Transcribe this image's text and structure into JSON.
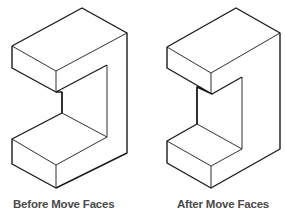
{
  "diagram": {
    "panels": [
      {
        "id": "before",
        "caption": "Before Move Faces",
        "shape": "C-shaped isometric block",
        "outline": [
          [
            82,
            8
          ],
          [
            127,
            33
          ],
          [
            127,
            153
          ],
          [
            56,
            188
          ],
          [
            12,
            164
          ],
          [
            12,
            139
          ],
          [
            62,
            113
          ],
          [
            62,
            92
          ],
          [
            56,
            92
          ],
          [
            12,
            68
          ],
          [
            12,
            46
          ]
        ],
        "upper_front_face": [
          [
            12,
            46
          ],
          [
            56,
            71
          ],
          [
            56,
            92
          ],
          [
            12,
            68
          ]
        ],
        "upper_front_edge": [
          [
            56,
            71
          ],
          [
            127,
            33
          ]
        ],
        "inner_back_face": [
          [
            62,
            92
          ],
          [
            107,
            65
          ],
          [
            107,
            137
          ],
          [
            62,
            113
          ]
        ],
        "lower_top_face": [
          [
            12,
            139
          ],
          [
            62,
            113
          ],
          [
            107,
            137
          ],
          [
            56,
            165
          ]
        ],
        "lower_front_edge": [
          [
            56,
            165
          ],
          [
            56,
            188
          ]
        ],
        "lower_right_edge": [
          [
            56,
            165
          ],
          [
            107,
            137
          ]
        ]
      },
      {
        "id": "after",
        "caption": "After Move Faces",
        "shape": "C-shaped isometric block with inner face moved",
        "outline": [
          [
            236,
            8
          ],
          [
            280,
            33
          ],
          [
            280,
            149
          ],
          [
            211,
            188
          ],
          [
            167,
            163
          ],
          [
            167,
            141
          ],
          [
            197,
            124
          ],
          [
            197,
            87
          ],
          [
            212,
            94
          ],
          [
            167,
            68
          ],
          [
            167,
            47
          ]
        ],
        "upper_front_face": [
          [
            167,
            47
          ],
          [
            211,
            73
          ],
          [
            211,
            94
          ],
          [
            167,
            68
          ]
        ],
        "upper_front_edge": [
          [
            211,
            73
          ],
          [
            280,
            33
          ]
        ],
        "inner_back_face": [
          [
            212,
            94
          ],
          [
            242,
            77
          ],
          [
            242,
            149
          ],
          [
            197,
            124
          ]
        ],
        "lower_top_face": [
          [
            167,
            141
          ],
          [
            197,
            124
          ],
          [
            242,
            149
          ],
          [
            211,
            166
          ]
        ],
        "lower_front_edge": [
          [
            211,
            166
          ],
          [
            211,
            188
          ]
        ],
        "lower_right_edge": [
          [
            211,
            166
          ],
          [
            242,
            149
          ]
        ]
      }
    ],
    "stroke_color": "#1a1a1a",
    "caption_color": "#4a4a4a"
  }
}
